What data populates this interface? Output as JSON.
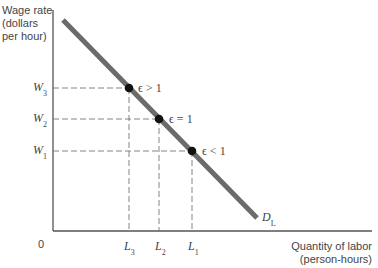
{
  "diagram": {
    "axes": {
      "y_label_lines": [
        "Wage rate",
        "(dollars",
        "per hour)"
      ],
      "x_label_lines": [
        "Quantity of labor",
        "(person-hours)"
      ],
      "origin": "0"
    },
    "curve": {
      "label": "D",
      "label_sub": "L",
      "color": "#6b6b6b"
    },
    "wages": [
      {
        "symbol": "W",
        "sub": "3"
      },
      {
        "symbol": "W",
        "sub": "2"
      },
      {
        "symbol": "W",
        "sub": "1"
      }
    ],
    "quantities": [
      {
        "symbol": "L",
        "sub": "3"
      },
      {
        "symbol": "L",
        "sub": "2"
      },
      {
        "symbol": "L",
        "sub": "1"
      }
    ],
    "points": [
      {
        "label": "ϵ > 1",
        "wage": "W3",
        "quantity": "L3"
      },
      {
        "label": "ϵ = 1",
        "wage": "W2",
        "quantity": "L2"
      },
      {
        "label": "ϵ < 1",
        "wage": "W1",
        "quantity": "L1"
      }
    ],
    "colors": {
      "axis": "#555555",
      "curve": "#6b6b6b",
      "dash": "#777777",
      "point": "#111111"
    }
  }
}
